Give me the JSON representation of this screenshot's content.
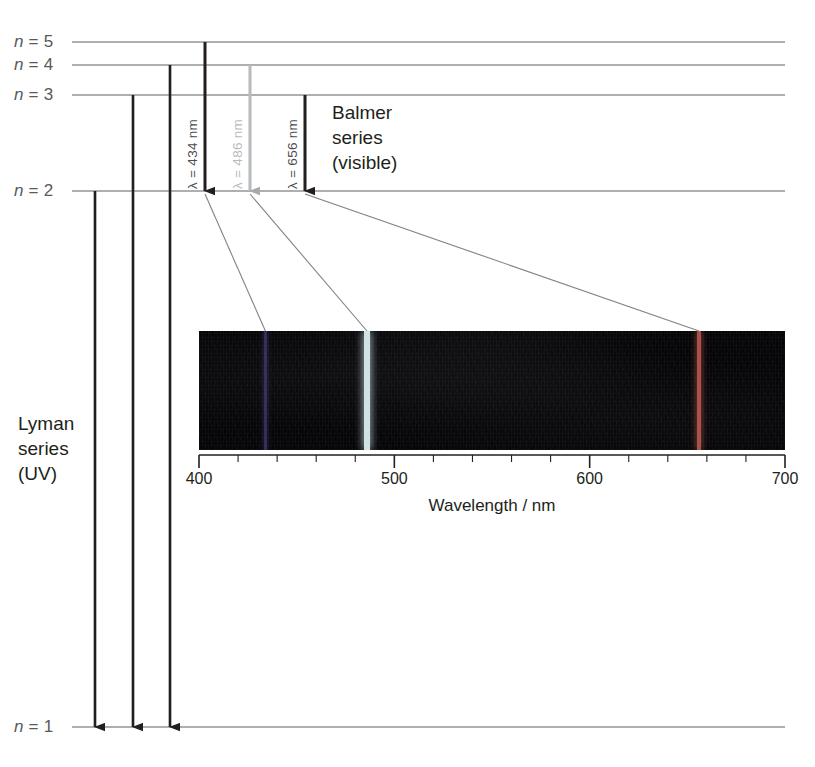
{
  "figure": {
    "width": 815,
    "height": 767
  },
  "energy_levels": [
    {
      "label": "n = 5",
      "n": 5,
      "y": 42
    },
    {
      "label": "n = 4",
      "n": 4,
      "y": 65
    },
    {
      "label": "n = 3",
      "n": 3,
      "y": 95
    },
    {
      "label": "n = 2",
      "n": 2,
      "y": 191
    },
    {
      "label": "n = 1",
      "n": 1,
      "y": 727
    }
  ],
  "series": [
    {
      "name": "balmer",
      "line1": "Balmer",
      "line2": "series",
      "line3": "(visible)",
      "x": 332,
      "y": 100
    },
    {
      "name": "lyman",
      "line1": "Lyman",
      "line2": "series",
      "line3": "(UV)",
      "x": 18,
      "y": 411
    }
  ],
  "balmer_transitions": [
    {
      "label": "λ = 434 nm",
      "wavelength": 434,
      "from_n": 5,
      "to_n": 2,
      "x": 205,
      "color": "#231f20",
      "tone": "dark"
    },
    {
      "label": "λ = 486 nm",
      "wavelength": 486,
      "from_n": 4,
      "to_n": 2,
      "x": 250,
      "color": "#b9babc",
      "tone": "light"
    },
    {
      "label": "λ = 656 nm",
      "wavelength": 656,
      "from_n": 3,
      "to_n": 2,
      "x": 305,
      "color": "#231f20",
      "tone": "dark"
    }
  ],
  "lyman_transitions": [
    {
      "from_n": 2,
      "to_n": 1,
      "x": 95,
      "color": "#231f20"
    },
    {
      "from_n": 3,
      "to_n": 1,
      "x": 133,
      "color": "#231f20"
    },
    {
      "from_n": 4,
      "to_n": 1,
      "x": 170,
      "color": "#231f20"
    }
  ],
  "axis": {
    "title": "Wavelength / nm",
    "title_x": 492,
    "title_y": 496,
    "x_left": 199,
    "x_right": 785,
    "y": 455,
    "min": 400,
    "max": 700,
    "major_ticks": [
      400,
      500,
      600,
      700
    ],
    "minor_step": 20,
    "tick_label_y": 470
  },
  "spectrum": {
    "x": 199,
    "y": 331,
    "width": 586,
    "height": 119,
    "background": "#050507",
    "lines": [
      {
        "wavelength": 434,
        "color": "#6f61c0",
        "width": 3,
        "opacity": 0.42,
        "name": "violet-line-434"
      },
      {
        "wavelength": 486,
        "color": "#cfe3e6",
        "width": 5.5,
        "opacity": 1.0,
        "name": "cyan-line-486"
      },
      {
        "wavelength": 656,
        "color": "#b6594f",
        "width": 4,
        "opacity": 0.92,
        "name": "red-line-656"
      }
    ]
  },
  "colors": {
    "level_line": "#939598",
    "guide_line": "#c9cacc",
    "leader_line": "#808285",
    "axis": "#231f20",
    "text": "#231f20",
    "label_gray": "#58595b"
  }
}
